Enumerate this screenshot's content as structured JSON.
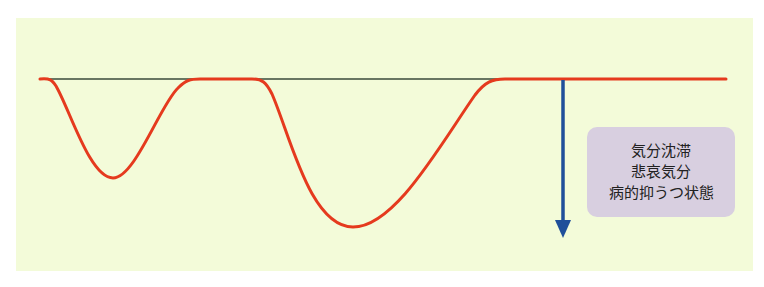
{
  "diagram": {
    "type": "mood-fluctuation-curve",
    "baseline_label": "",
    "colors": {
      "background_panel": "#f3fbd9",
      "baseline": "#3a4a3a",
      "curve": "#e53a1e",
      "arrow": "#1f4f9a",
      "label_box": "#d8cfe0"
    },
    "curve_dips": [
      {
        "center_x": 113,
        "depth_y": 178,
        "description": "shallow dip"
      },
      {
        "center_x": 353,
        "depth_y": 227,
        "description": "deeper dip"
      }
    ],
    "arrow": {
      "direction": "down",
      "x": 563,
      "from_y": 79,
      "to_y": 237
    }
  },
  "label_box": {
    "lines": [
      "気分沈滞",
      "悲哀気分",
      "病的抑うつ状態"
    ]
  }
}
